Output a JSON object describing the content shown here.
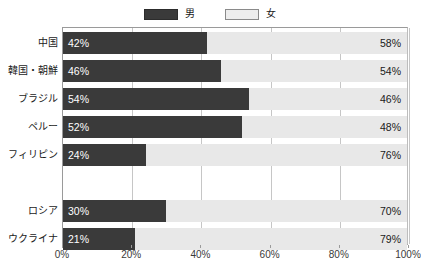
{
  "chart_data": {
    "type": "bar",
    "subtype": "stacked-horizontal-100",
    "title": "",
    "xlabel": "",
    "ylabel": "",
    "xlim": [
      0,
      100
    ],
    "xticks": [
      0,
      20,
      40,
      60,
      80,
      100
    ],
    "xtick_labels": [
      "0%",
      "20%",
      "40%",
      "60%",
      "80%",
      "100%"
    ],
    "grid": true,
    "legend_position": "top-center",
    "categories": [
      "中国",
      "韓国・朝鮮",
      "ブラジル",
      "ペルー",
      "フィリピン",
      "ロシア",
      "ウクライナ"
    ],
    "series": [
      {
        "name": "男",
        "color": "#3a3a3a",
        "values": [
          42,
          46,
          54,
          52,
          24,
          30,
          21
        ],
        "labels": [
          "42%",
          "46%",
          "54%",
          "52%",
          "24%",
          "30%",
          "21%"
        ]
      },
      {
        "name": "女",
        "color": "#e8e8e8",
        "values": [
          58,
          54,
          46,
          48,
          76,
          70,
          79
        ],
        "labels": [
          "58%",
          "54%",
          "46%",
          "48%",
          "76%",
          "70%",
          "79%"
        ]
      }
    ],
    "group_break_after_index": 4
  },
  "legend": {
    "items": [
      {
        "label": "男",
        "swatch": "male"
      },
      {
        "label": "女",
        "swatch": "female"
      }
    ]
  },
  "colors": {
    "male": "#3a3a3a",
    "female": "#e8e8e8",
    "axis": "#9a9a9a",
    "grid": "#c6c6c6",
    "text": "#1a1a1a",
    "value_on_dark": "#ffffff"
  }
}
